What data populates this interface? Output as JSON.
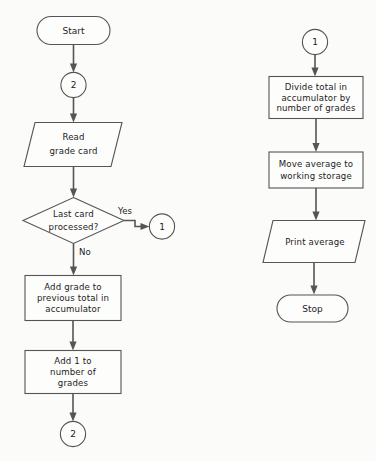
{
  "diagram": {
    "type": "flowchart",
    "colors": {
      "background": "#fbfbfa",
      "stroke": "#555555",
      "shape_fill": "#fdfdfc",
      "text": "#1c1c1c"
    }
  },
  "left_column": {
    "start_terminator": {
      "label": "Start"
    },
    "connector_in": {
      "label": "2"
    },
    "read_io": {
      "line1": "Read",
      "line2": "grade card"
    },
    "decision": {
      "line1": "Last card",
      "line2": "processed?"
    },
    "decision_yes_label": "Yes",
    "decision_no_label": "No",
    "connector_yes_out": {
      "label": "1"
    },
    "add_grade_process": {
      "line1": "Add grade to",
      "line2": "previous total in",
      "line3": "accumulator"
    },
    "add_count_process": {
      "line1": "Add 1 to",
      "line2": "number of",
      "line3": "grades"
    },
    "connector_loop_out": {
      "label": "2"
    }
  },
  "right_column": {
    "connector_in": {
      "label": "1"
    },
    "divide_process": {
      "line1": "Divide total in",
      "line2": "accumulator by",
      "line3": "number of grades"
    },
    "move_process": {
      "line1": "Move average to",
      "line2": "working storage"
    },
    "print_io": {
      "label": "Print average"
    },
    "stop_terminator": {
      "label": "Stop"
    }
  }
}
